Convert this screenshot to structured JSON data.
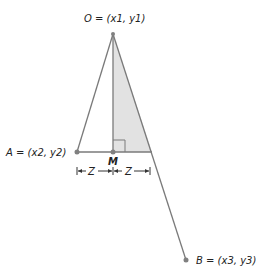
{
  "labels": {
    "O": "O = (x1, y1)",
    "A": "A = (x2, y2)",
    "B": "B = (x3, y3)",
    "M": "M",
    "Z_left": "Z",
    "Z_right": "Z"
  },
  "colors": {
    "line": "#7a7a7a",
    "fill": "#e2e2e2",
    "point": "#808080",
    "text": "#222222"
  }
}
